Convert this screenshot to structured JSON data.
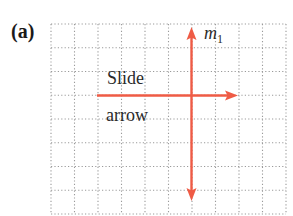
{
  "figure": {
    "panel_label": "(a)",
    "grid": {
      "columns": 10,
      "rows": 8,
      "line_style": "dotted",
      "line_color": "#9a9a9a"
    },
    "slide_arrow": {
      "label_line1": "Slide",
      "label_line2": "arrow",
      "direction": "right",
      "color": "#ef5b45"
    },
    "mirror_line": {
      "label": "m",
      "subscript": "1",
      "direction": "vertical, double-headed",
      "color": "#ef5b45"
    }
  }
}
